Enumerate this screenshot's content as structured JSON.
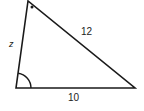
{
  "diagram": {
    "type": "triangle",
    "vertices": {
      "top": [
        28,
        1
      ],
      "bottom_left": [
        16,
        88
      ],
      "bottom_right": [
        135,
        88
      ]
    },
    "sides": {
      "left": {
        "label": "z"
      },
      "hypotenuse": {
        "label": "12"
      },
      "base": {
        "label": "10"
      }
    },
    "markers": {
      "top_angle": "dot",
      "bottom_left_angle": "arc"
    },
    "colors": {
      "stroke": "#1a1a1a",
      "background": "#ffffff"
    }
  }
}
